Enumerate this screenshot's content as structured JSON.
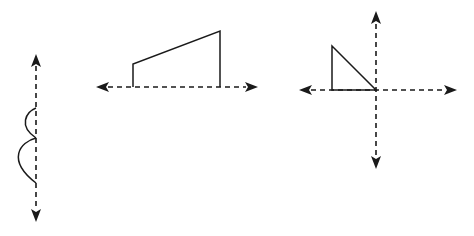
{
  "diagram": {
    "colors": {
      "stroke": "#1a1a1a",
      "background": "#ffffff"
    },
    "figures": [
      {
        "id": "figure-1",
        "type": "curve-on-vertical-axis",
        "axis": {
          "orientation": "vertical",
          "x": 36,
          "y_start": 56,
          "y_end": 220,
          "style": "dashed",
          "arrowheads": [
            "up",
            "down"
          ]
        },
        "curves": [
          {
            "label": "upper-arc",
            "from": [
              36,
              108
            ],
            "to": [
              36,
              138
            ],
            "bulge_to_x": 22
          },
          {
            "label": "lower-arc",
            "from": [
              36,
              138
            ],
            "to": [
              36,
              183
            ],
            "bulge_to_x": 12
          }
        ]
      },
      {
        "id": "figure-2",
        "type": "trapezoid-on-horizontal-axis",
        "axis": {
          "orientation": "horizontal",
          "y": 87,
          "x_start": 97,
          "x_end": 256,
          "style": "dashed",
          "arrowheads": [
            "left",
            "right"
          ]
        },
        "shape": {
          "points": [
            [
              133,
              87
            ],
            [
              133,
              64
            ],
            [
              220,
              31
            ],
            [
              220,
              87
            ]
          ]
        }
      },
      {
        "id": "figure-3",
        "type": "triangle-on-cartesian-axes",
        "axes": {
          "origin": [
            376,
            90
          ],
          "horizontal": {
            "x_start": 300,
            "x_end": 456,
            "style": "dashed",
            "arrowheads": [
              "left",
              "right"
            ]
          },
          "vertical": {
            "y_start": 12,
            "y_end": 168,
            "style": "dashed",
            "arrowheads": [
              "up",
              "down"
            ]
          }
        },
        "shape": {
          "points": [
            [
              332,
              46
            ],
            [
              332,
              90
            ],
            [
              376,
              90
            ]
          ]
        }
      }
    ]
  }
}
